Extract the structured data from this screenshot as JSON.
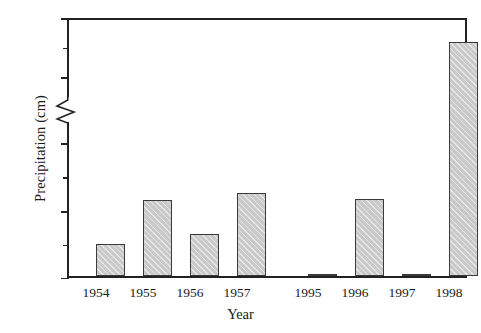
{
  "chart_data": {
    "type": "bar",
    "title": "",
    "xlabel": "Year",
    "ylabel": "Precipitation (cm)",
    "categories": [
      "1954",
      "1955",
      "1956",
      "1957",
      "1995",
      "1996",
      "1997",
      "1998"
    ],
    "values": [
      5.0,
      11.6,
      6.5,
      12.6,
      20.6,
      11.7,
      20.7,
      66.0
    ],
    "ylim": [
      0,
      70
    ],
    "grid": false,
    "legend": null,
    "broken_axis": {
      "present": true,
      "lower_segment": [
        0,
        20
      ],
      "upper_segment": [
        60,
        70
      ],
      "marker": "zigzag"
    },
    "y_ticks_labeled": [
      "0",
      "10",
      "20",
      "60",
      "70"
    ],
    "y_tick_values_labeled": [
      0,
      10,
      20,
      60,
      70
    ],
    "y_ticks_minor_values": [
      5,
      15,
      65
    ],
    "category_gap_after_index": 3,
    "bar_fill_color": "#c9c9c9",
    "bar_edge_color": "#3a3a3a",
    "axis_color": "#222222",
    "background_color": "#ffffff"
  },
  "axis": {
    "y_title": "Precipitation (cm)",
    "x_title": "Year"
  }
}
